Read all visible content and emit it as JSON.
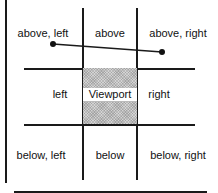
{
  "diagram": {
    "regions": {
      "above_left": "above, left",
      "above": "above",
      "above_right": "above, right",
      "left": "left",
      "viewport": "Viewport",
      "right": "right",
      "below_left": "below, left",
      "below": "below",
      "below_right": "below, right"
    },
    "segment": {
      "from": [
        53,
        44
      ],
      "to": [
        162,
        52
      ]
    },
    "colors": {
      "line": "#1a1a1a",
      "viewport_fill": "#d4d4d4"
    }
  }
}
